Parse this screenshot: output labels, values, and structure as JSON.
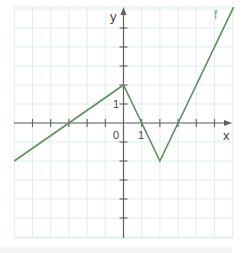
{
  "chart_data": {
    "type": "line",
    "title": "",
    "xlabel": "x",
    "ylabel": "y",
    "series": [
      {
        "name": "f",
        "points": [
          [
            -6,
            -2
          ],
          [
            0,
            2
          ],
          [
            2,
            -2
          ],
          [
            6.05,
            6.1
          ]
        ],
        "color": "#5b8f5b"
      }
    ],
    "xlim": [
      -6,
      6
    ],
    "ylim": [
      -6.1,
      6.1
    ],
    "x_ticks": [
      -5,
      -4,
      -3,
      -2,
      -1,
      0,
      1,
      2,
      3,
      4,
      5
    ],
    "y_ticks": [
      -5,
      -4,
      -3,
      -2,
      -1,
      0,
      1,
      2,
      3,
      4,
      5
    ],
    "tick_labels": {
      "origin": "0",
      "x_unit": "1",
      "y_unit": "1"
    },
    "grid": true,
    "legend": "inline label 'f' near top-right of curve",
    "key_points": {
      "left_endpoint": [
        -6,
        -2
      ],
      "x_intercepts": [
        -3,
        1,
        3
      ],
      "local_max": [
        0,
        2
      ],
      "local_min": [
        2,
        -2
      ]
    }
  },
  "labels": {
    "x_axis": "x",
    "y_axis": "y",
    "origin": "0",
    "x_one": "1",
    "y_one": "1",
    "function": "f"
  },
  "colors": {
    "grid": "#dcefed",
    "axis": "#5e6060",
    "curve": "#5b8f5b",
    "function_label": "#7aa87a"
  }
}
